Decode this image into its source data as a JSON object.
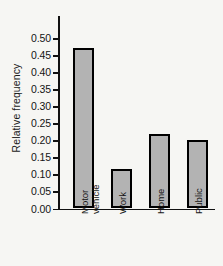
{
  "chart_data": {
    "type": "bar",
    "title": "",
    "xlabel": "",
    "ylabel": "Relative frequency",
    "categories": [
      "Motor vehicle",
      "Work",
      "Home",
      "Public"
    ],
    "values": [
      0.47,
      0.117,
      0.218,
      0.201
    ],
    "ylim": [
      0.0,
      0.5
    ],
    "ytick_labels": [
      "0.00",
      "0.05",
      "0.10",
      "0.15",
      "0.20",
      "0.25",
      "0.30",
      "0.35",
      "0.40",
      "0.45",
      "0.50"
    ],
    "ytick_values": [
      0.0,
      0.05,
      0.1,
      0.15,
      0.2,
      0.25,
      0.3,
      0.35,
      0.4,
      0.45,
      0.5
    ],
    "grid": false,
    "legend": null,
    "bar_color": "#b3b3b3",
    "bar_edge_color": "#000000",
    "axis_color": "#111111",
    "background_color": "#f6f6f3"
  }
}
